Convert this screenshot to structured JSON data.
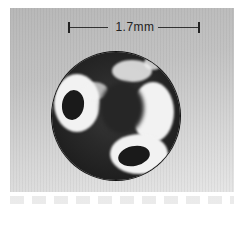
{
  "figure": {
    "scale_bar": {
      "label": "1.7mm"
    },
    "colors": {
      "background_top": "#b8b8b8",
      "background_bottom": "#e6e6e6",
      "sphere": "#2a2a2a",
      "highlight": "#f2f2f2"
    },
    "caption": ""
  }
}
